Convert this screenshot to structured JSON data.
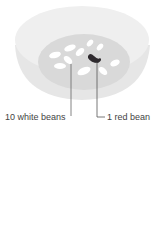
{
  "diagram": {
    "labels": {
      "white": "10 white beans",
      "red": "1 red bean"
    },
    "colors": {
      "bowl_outer": "#eeeeee",
      "bowl_rim": "#e4e4e4",
      "bowl_inner": "#d8d8d8",
      "white_bean": "#ffffff",
      "red_bean": "#2e2a2e",
      "leader": "#555555",
      "text": "#444444"
    }
  }
}
